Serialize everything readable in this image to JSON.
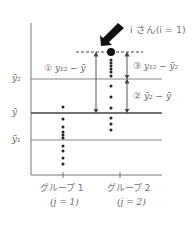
{
  "diagram": {
    "type": "anova-decomposition",
    "callout": "i さん(i = 1)",
    "y_labels": {
      "ybar2": "ȳ₂",
      "ybar": "ȳ",
      "ybar1": "ȳ₁"
    },
    "annotations": [
      {
        "id": "1",
        "marker": "①",
        "text": "y₁₂ − ȳ"
      },
      {
        "id": "3",
        "marker": "③",
        "text": "y₁₂ − ȳ₂"
      },
      {
        "id": "2",
        "marker": "②",
        "text": "ȳ₂ − ȳ"
      }
    ],
    "groups": [
      {
        "label": "グループ 1",
        "sub": "(j = 1)"
      },
      {
        "label": "グループ 2",
        "sub": "(j = 2)"
      }
    ],
    "colors": {
      "line": "#666666",
      "dot": "#222222",
      "text": "#666666"
    }
  }
}
